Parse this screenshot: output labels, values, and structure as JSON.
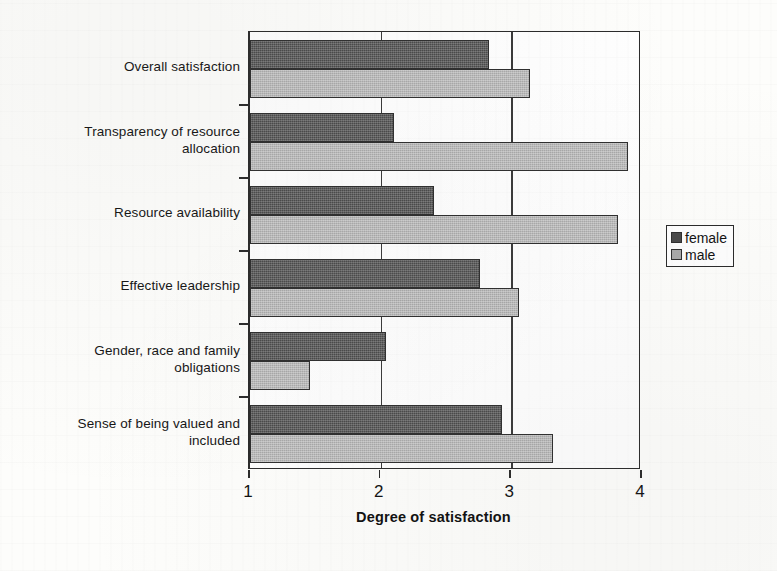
{
  "chart_data": {
    "type": "bar",
    "orientation": "horizontal",
    "title": "",
    "xlabel": "Degree of satisfaction",
    "ylabel": "",
    "xlim": [
      1,
      4
    ],
    "xticks": [
      "1",
      "2",
      "3",
      "4"
    ],
    "grid": "vertical",
    "legend_position": "right",
    "categories": [
      "Overall satisfaction",
      "Transparency of resource allocation",
      "Resource availability",
      "Effective leadership",
      "Gender, race and family obligations",
      "Sense of being valued and included"
    ],
    "category_lines": [
      [
        "Overall satisfaction"
      ],
      [
        "Transparency of resource",
        "allocation"
      ],
      [
        "Resource availability"
      ],
      [
        "Effective leadership"
      ],
      [
        "Gender, race and family",
        "obligations"
      ],
      [
        "Sense of being valued and",
        "included"
      ]
    ],
    "series": [
      {
        "name": "female",
        "color": "#4a4a4a",
        "values": [
          2.83,
          2.1,
          2.41,
          2.76,
          2.04,
          2.93
        ]
      },
      {
        "name": "male",
        "color": "#a9a9a9",
        "values": [
          3.14,
          3.89,
          3.82,
          3.06,
          1.46,
          3.32
        ]
      }
    ]
  },
  "legend": {
    "items": [
      {
        "label": "female",
        "swatch": "female-swatch-icon"
      },
      {
        "label": "male",
        "swatch": "male-swatch-icon"
      }
    ]
  },
  "axis": {
    "x_title": "Degree of satisfaction",
    "x_tick_labels": [
      "1",
      "2",
      "3",
      "4"
    ]
  }
}
